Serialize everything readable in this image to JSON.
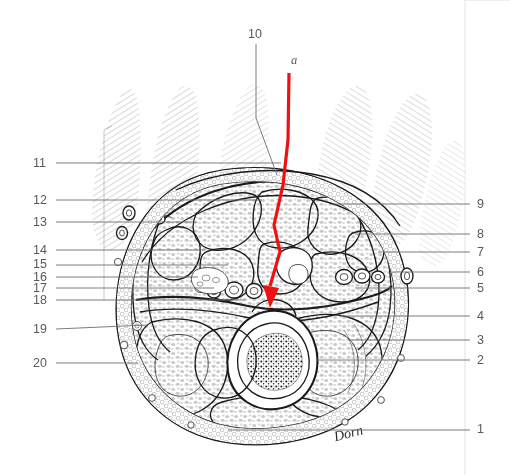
{
  "figure": {
    "background_color": "#ffffff",
    "ink_color": "#1b1b1b",
    "label_color": "#5a5a5a",
    "leader_color": "#6e6e6e",
    "marker_color": "#ee1111",
    "signature": "Dorn"
  },
  "marker": {
    "letter": "a",
    "letter_x": 291,
    "letter_y": 64,
    "line_color": "#ee1111",
    "line_top_x": 289,
    "line_top_y": 73,
    "line_tip_x": 272,
    "line_tip_y": 307
  },
  "labels_left": [
    {
      "text": "11",
      "x": 33,
      "y": 167,
      "line_x1": 56,
      "line_y1": 163,
      "line_x2": 281,
      "line_y2": 163
    },
    {
      "text": "12",
      "x": 33,
      "y": 204,
      "line_x1": 56,
      "line_y1": 200,
      "line_x2": 262,
      "line_y2": 200
    },
    {
      "text": "13",
      "x": 33,
      "y": 226,
      "line_x1": 56,
      "line_y1": 222,
      "line_x2": 196,
      "line_y2": 222
    },
    {
      "text": "14",
      "x": 33,
      "y": 254,
      "line_x1": 56,
      "line_y1": 250,
      "line_x2": 205,
      "line_y2": 250
    },
    {
      "text": "15",
      "x": 33,
      "y": 268,
      "line_x1": 56,
      "line_y1": 265,
      "line_x2": 228,
      "line_y2": 265
    },
    {
      "text": "16",
      "x": 33,
      "y": 281,
      "line_x1": 56,
      "line_y1": 277,
      "line_x2": 198,
      "line_y2": 277
    },
    {
      "text": "17",
      "x": 33,
      "y": 292,
      "line_x1": 56,
      "line_y1": 288,
      "line_x2": 214,
      "line_y2": 288
    },
    {
      "text": "18",
      "x": 33,
      "y": 304,
      "line_x1": 56,
      "line_y1": 300,
      "line_x2": 245,
      "line_y2": 300
    },
    {
      "text": "19",
      "x": 33,
      "y": 333,
      "line_x1": 56,
      "line_y1": 329,
      "line_x2": 147,
      "line_y2": 325
    },
    {
      "text": "20",
      "x": 33,
      "y": 367,
      "line_x1": 56,
      "line_y1": 363,
      "line_x2": 138,
      "line_y2": 363
    }
  ],
  "labels_right": [
    {
      "text": "9",
      "x": 477,
      "y": 208,
      "line_x1": 470,
      "line_y1": 204,
      "line_x2": 333,
      "line_y2": 204
    },
    {
      "text": "8",
      "x": 477,
      "y": 238,
      "line_x1": 470,
      "line_y1": 234,
      "line_x2": 355,
      "line_y2": 234
    },
    {
      "text": "7",
      "x": 477,
      "y": 256,
      "line_x1": 470,
      "line_y1": 252,
      "line_x2": 378,
      "line_y2": 252
    },
    {
      "text": "6",
      "x": 477,
      "y": 276,
      "line_x1": 470,
      "line_y1": 272,
      "line_x2": 392,
      "line_y2": 272
    },
    {
      "text": "5",
      "x": 477,
      "y": 292,
      "line_x1": 470,
      "line_y1": 288,
      "line_x2": 355,
      "line_y2": 288
    },
    {
      "text": "4",
      "x": 477,
      "y": 320,
      "line_x1": 470,
      "line_y1": 316,
      "line_x2": 340,
      "line_y2": 316
    },
    {
      "text": "3",
      "x": 477,
      "y": 344,
      "line_x1": 470,
      "line_y1": 340,
      "line_x2": 348,
      "line_y2": 340
    },
    {
      "text": "2",
      "x": 477,
      "y": 364,
      "line_x1": 470,
      "line_y1": 360,
      "line_x2": 316,
      "line_y2": 360
    },
    {
      "text": "1",
      "x": 477,
      "y": 433,
      "line_x1": 470,
      "line_y1": 430,
      "line_x2": 228,
      "line_y2": 430
    }
  ],
  "label_top": {
    "text": "10",
    "x": 248,
    "y": 38,
    "leader_path": "M 256 44 L 256 118 L 277 175"
  }
}
